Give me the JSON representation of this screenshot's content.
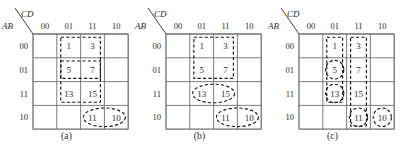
{
  "figure": {
    "title": "",
    "maps": [
      {
        "caption": "(a)",
        "col_var": "CD",
        "row_var": "AB",
        "col_headers": [
          "00",
          "01",
          "11",
          "10"
        ],
        "row_headers": [
          "00",
          "01",
          "11",
          "10"
        ],
        "cells": [
          {
            "row": 0,
            "col": 0,
            "label": ""
          },
          {
            "row": 0,
            "col": 1,
            "label": "1"
          },
          {
            "row": 0,
            "col": 2,
            "label": "3"
          },
          {
            "row": 0,
            "col": 3,
            "label": ""
          },
          {
            "row": 1,
            "col": 0,
            "label": ""
          },
          {
            "row": 1,
            "col": 1,
            "label": "5"
          },
          {
            "row": 1,
            "col": 2,
            "label": "7"
          },
          {
            "row": 1,
            "col": 3,
            "label": ""
          },
          {
            "row": 2,
            "col": 0,
            "label": ""
          },
          {
            "row": 2,
            "col": 1,
            "label": "13"
          },
          {
            "row": 2,
            "col": 2,
            "label": "15"
          },
          {
            "row": 2,
            "col": 3,
            "label": ""
          },
          {
            "row": 3,
            "col": 0,
            "label": ""
          },
          {
            "row": 3,
            "col": 1,
            "label": ""
          },
          {
            "row": 3,
            "col": 2,
            "label": "11"
          },
          {
            "row": 3,
            "col": 3,
            "label": "10"
          }
        ],
        "groups": [
          {
            "name": "group-rect-1-3-5-7-13-15",
            "shape": "rect",
            "row0": 0,
            "col0": 1,
            "row1": 2,
            "col1": 2
          },
          {
            "name": "group-rect-5-7",
            "shape": "rect",
            "row0": 1,
            "col0": 1,
            "row1": 1,
            "col1": 2
          },
          {
            "name": "group-oval-11-10",
            "shape": "oval",
            "row0": 3,
            "col0": 2,
            "row1": 3,
            "col1": 3
          }
        ]
      },
      {
        "caption": "(b)",
        "col_var": "CD",
        "row_var": "AB",
        "col_headers": [
          "00",
          "01",
          "11",
          "10"
        ],
        "row_headers": [
          "00",
          "01",
          "11",
          "10"
        ],
        "cells": [
          {
            "row": 0,
            "col": 0,
            "label": ""
          },
          {
            "row": 0,
            "col": 1,
            "label": "1"
          },
          {
            "row": 0,
            "col": 2,
            "label": "3"
          },
          {
            "row": 0,
            "col": 3,
            "label": ""
          },
          {
            "row": 1,
            "col": 0,
            "label": ""
          },
          {
            "row": 1,
            "col": 1,
            "label": "5"
          },
          {
            "row": 1,
            "col": 2,
            "label": "7"
          },
          {
            "row": 1,
            "col": 3,
            "label": ""
          },
          {
            "row": 2,
            "col": 0,
            "label": ""
          },
          {
            "row": 2,
            "col": 1,
            "label": "13"
          },
          {
            "row": 2,
            "col": 2,
            "label": "15"
          },
          {
            "row": 2,
            "col": 3,
            "label": ""
          },
          {
            "row": 3,
            "col": 0,
            "label": ""
          },
          {
            "row": 3,
            "col": 1,
            "label": ""
          },
          {
            "row": 3,
            "col": 2,
            "label": "11"
          },
          {
            "row": 3,
            "col": 3,
            "label": "10"
          }
        ],
        "groups": [
          {
            "name": "group-rect-1-3-5-7",
            "shape": "rect",
            "row0": 0,
            "col0": 1,
            "row1": 1,
            "col1": 2
          },
          {
            "name": "group-oval-13-15",
            "shape": "oval",
            "row0": 2,
            "col0": 1,
            "row1": 2,
            "col1": 2
          },
          {
            "name": "group-oval-11-10",
            "shape": "oval",
            "row0": 3,
            "col0": 2,
            "row1": 3,
            "col1": 3
          }
        ]
      },
      {
        "caption": "(c)",
        "col_var": "CD",
        "row_var": "AB",
        "col_headers": [
          "00",
          "01",
          "11",
          "10"
        ],
        "row_headers": [
          "00",
          "01",
          "11",
          "10"
        ],
        "cells": [
          {
            "row": 0,
            "col": 0,
            "label": ""
          },
          {
            "row": 0,
            "col": 1,
            "label": "1"
          },
          {
            "row": 0,
            "col": 2,
            "label": "3"
          },
          {
            "row": 0,
            "col": 3,
            "label": ""
          },
          {
            "row": 1,
            "col": 0,
            "label": ""
          },
          {
            "row": 1,
            "col": 1,
            "label": "5"
          },
          {
            "row": 1,
            "col": 2,
            "label": "7"
          },
          {
            "row": 1,
            "col": 3,
            "label": ""
          },
          {
            "row": 2,
            "col": 0,
            "label": ""
          },
          {
            "row": 2,
            "col": 1,
            "label": "13"
          },
          {
            "row": 2,
            "col": 2,
            "label": "15"
          },
          {
            "row": 2,
            "col": 3,
            "label": ""
          },
          {
            "row": 3,
            "col": 0,
            "label": ""
          },
          {
            "row": 3,
            "col": 1,
            "label": ""
          },
          {
            "row": 3,
            "col": 2,
            "label": "11"
          },
          {
            "row": 3,
            "col": 3,
            "label": "10"
          }
        ],
        "groups": [
          {
            "name": "group-rect-col01-1-5-13",
            "shape": "rect",
            "row0": 0,
            "col0": 1,
            "row1": 2,
            "col1": 1
          },
          {
            "name": "group-rect-col11-3-7-15-11",
            "shape": "rect",
            "row0": 0,
            "col0": 2,
            "row1": 3,
            "col1": 2
          },
          {
            "name": "group-oval-5",
            "shape": "oval",
            "row0": 1,
            "col0": 1,
            "row1": 1,
            "col1": 1
          },
          {
            "name": "group-oval-13",
            "shape": "oval",
            "row0": 2,
            "col0": 1,
            "row1": 2,
            "col1": 1
          },
          {
            "name": "group-oval-11",
            "shape": "oval",
            "row0": 3,
            "col0": 2,
            "row1": 3,
            "col1": 2
          },
          {
            "name": "group-oval-10",
            "shape": "oval",
            "row0": 3,
            "col0": 3,
            "row1": 3,
            "col1": 3
          }
        ]
      }
    ]
  },
  "style": {
    "grid_color": "#6e6e6e",
    "group_color": "#1a1a1a",
    "text_color": "#2b2b2b",
    "background": "#ffffff"
  },
  "geometry": {
    "grid_x": 33,
    "grid_y": 34,
    "cell_w": 23.8,
    "cell_h": 23.8
  }
}
